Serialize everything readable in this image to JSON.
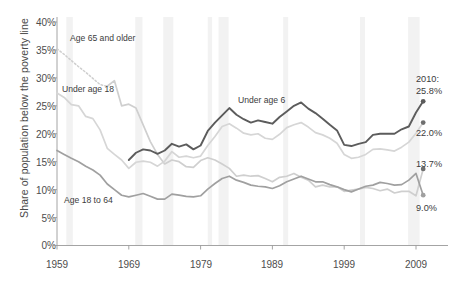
{
  "chart_data": {
    "type": "line",
    "title": "",
    "subtitle": "",
    "xlabel": "",
    "ylabel": "Share of population below the poverty line",
    "xlim": [
      1959,
      2011
    ],
    "ylim": [
      0,
      40
    ],
    "ytick_labels": [
      "0%",
      "5%",
      "10%",
      "15%",
      "20%",
      "25%",
      "30%",
      "35%",
      "40%"
    ],
    "ytick_values": [
      0,
      5,
      10,
      15,
      20,
      25,
      30,
      35,
      40
    ],
    "xtick_labels": [
      "1959",
      "1969",
      "1979",
      "1989",
      "1999",
      "2009"
    ],
    "xtick_values": [
      1959,
      1969,
      1979,
      1989,
      1999,
      2009
    ],
    "grid": false,
    "legend_position": "inline-annotations",
    "shaded_bands_note": "Vertical light-gray bands mark U.S. recessions",
    "recession_bands": [
      [
        1960.3,
        1961.2
      ],
      [
        1969.9,
        1970.9
      ],
      [
        1973.8,
        1975.2
      ],
      [
        1980.0,
        1980.6
      ],
      [
        1981.5,
        1982.9
      ],
      [
        1990.5,
        1991.2
      ],
      [
        2001.2,
        2001.9
      ],
      [
        2007.9,
        2009.5
      ]
    ],
    "series": [
      {
        "name": "Age 65 and older",
        "color": "#cfcfcf",
        "label_x": 70,
        "label_y": 38,
        "end_value": 13.7,
        "end_label": "13.7%",
        "dashed_segment": [
          1959,
          1966
        ],
        "x": [
          1959,
          1960,
          1961,
          1962,
          1963,
          1964,
          1965,
          1966,
          1967,
          1968,
          1969,
          1970,
          1971,
          1972,
          1973,
          1974,
          1975,
          1976,
          1977,
          1978,
          1979,
          1980,
          1981,
          1982,
          1983,
          1984,
          1985,
          1986,
          1987,
          1988,
          1989,
          1990,
          1991,
          1992,
          1993,
          1994,
          1995,
          1996,
          1997,
          1998,
          1999,
          2000,
          2001,
          2002,
          2003,
          2004,
          2005,
          2006,
          2007,
          2008,
          2009,
          2010
        ],
        "values": [
          35.2,
          34.2,
          33.1,
          32.0,
          31.0,
          29.9,
          28.8,
          28.5,
          29.5,
          25.0,
          25.3,
          24.6,
          21.6,
          18.6,
          16.3,
          14.6,
          15.3,
          15.0,
          14.1,
          14.0,
          15.2,
          15.7,
          15.3,
          14.6,
          13.8,
          12.4,
          12.6,
          12.4,
          12.5,
          12.0,
          11.4,
          12.2,
          12.4,
          12.9,
          12.2,
          11.7,
          10.5,
          10.8,
          10.5,
          10.5,
          9.7,
          9.9,
          10.1,
          10.4,
          10.2,
          9.8,
          10.1,
          9.4,
          9.7,
          9.7,
          8.9,
          13.7
        ]
      },
      {
        "name": "Under age 18",
        "color": "#d6d6d6",
        "label_x": 62,
        "label_y": 85,
        "end_value": 22.0,
        "end_label": "22.0%",
        "x": [
          1959,
          1960,
          1961,
          1962,
          1963,
          1964,
          1965,
          1966,
          1967,
          1968,
          1969,
          1970,
          1971,
          1972,
          1973,
          1974,
          1975,
          1976,
          1977,
          1978,
          1979,
          1980,
          1981,
          1982,
          1983,
          1984,
          1985,
          1986,
          1987,
          1988,
          1989,
          1990,
          1991,
          1992,
          1993,
          1994,
          1995,
          1996,
          1997,
          1998,
          1999,
          2000,
          2001,
          2002,
          2003,
          2004,
          2005,
          2006,
          2007,
          2008,
          2009,
          2010
        ],
        "values": [
          27.3,
          26.5,
          25.2,
          25.0,
          23.1,
          22.7,
          20.7,
          17.4,
          16.3,
          15.3,
          13.8,
          14.9,
          15.1,
          14.9,
          14.2,
          15.1,
          16.8,
          15.8,
          16.0,
          15.7,
          16.0,
          17.9,
          19.5,
          21.3,
          21.8,
          21.0,
          20.1,
          19.8,
          20.0,
          19.2,
          19.0,
          19.9,
          21.1,
          21.6,
          22.0,
          21.2,
          20.2,
          19.8,
          19.2,
          18.3,
          16.3,
          15.6,
          15.8,
          16.3,
          17.2,
          17.3,
          17.1,
          16.9,
          17.6,
          18.5,
          20.1,
          22.0
        ]
      },
      {
        "name": "Under age 6",
        "color": "#5c5c5c",
        "label_x": 238,
        "label_y": 93,
        "end_value": 25.8,
        "end_label": "25.8%",
        "x": [
          1969,
          1970,
          1971,
          1972,
          1973,
          1974,
          1975,
          1976,
          1977,
          1978,
          1979,
          1980,
          1981,
          1982,
          1983,
          1984,
          1985,
          1986,
          1987,
          1988,
          1989,
          1990,
          1991,
          1992,
          1993,
          1994,
          1995,
          1996,
          1997,
          1998,
          1999,
          2000,
          2001,
          2002,
          2003,
          2004,
          2005,
          2006,
          2007,
          2008,
          2009,
          2010
        ],
        "values": [
          15.3,
          16.6,
          17.2,
          17.0,
          16.4,
          17.0,
          18.2,
          17.7,
          18.1,
          17.2,
          17.9,
          20.5,
          22.0,
          23.3,
          24.6,
          23.4,
          22.6,
          22.0,
          22.4,
          22.1,
          21.8,
          23.0,
          24.0,
          25.0,
          25.6,
          24.5,
          23.7,
          22.7,
          21.6,
          20.6,
          18.0,
          17.8,
          18.2,
          18.5,
          19.8,
          20.0,
          20.0,
          20.0,
          20.8,
          21.3,
          23.8,
          25.8
        ]
      },
      {
        "name": "Age 18 to 64",
        "color": "#a0a0a0",
        "label_x": 64,
        "label_y": 195,
        "end_value": 9.0,
        "end_label": "9.0%",
        "x": [
          1959,
          1960,
          1961,
          1962,
          1963,
          1964,
          1965,
          1966,
          1967,
          1968,
          1969,
          1970,
          1971,
          1972,
          1973,
          1974,
          1975,
          1976,
          1977,
          1978,
          1979,
          1980,
          1981,
          1982,
          1983,
          1984,
          1985,
          1986,
          1987,
          1988,
          1989,
          1990,
          1991,
          1992,
          1993,
          1994,
          1995,
          1996,
          1997,
          1998,
          1999,
          2000,
          2001,
          2002,
          2003,
          2004,
          2005,
          2006,
          2007,
          2008,
          2009,
          2010
        ],
        "values": [
          17.0,
          16.3,
          15.6,
          15.0,
          14.2,
          13.5,
          12.6,
          11.0,
          10.0,
          9.0,
          8.7,
          9.0,
          9.3,
          8.8,
          8.3,
          8.3,
          9.2,
          9.0,
          8.8,
          8.7,
          8.9,
          10.1,
          11.1,
          12.0,
          12.4,
          11.7,
          11.3,
          10.8,
          10.6,
          10.5,
          10.2,
          10.7,
          11.4,
          11.9,
          12.4,
          11.9,
          11.4,
          11.4,
          10.9,
          10.5,
          10.0,
          9.6,
          10.1,
          10.6,
          10.8,
          11.3,
          11.1,
          10.8,
          10.9,
          11.7,
          12.9,
          9.0
        ]
      }
    ],
    "annotations": [
      {
        "name": "end-callout-under6",
        "text_line1": "2010:",
        "text_line2": "25.8%"
      },
      {
        "name": "end-callout-under18",
        "text": "22.0%"
      },
      {
        "name": "end-callout-65plus",
        "text": "13.7%"
      },
      {
        "name": "end-callout-18to64",
        "text": "9.0%"
      }
    ]
  },
  "labels": {
    "y_axis_title": "Share of population below the poverty line",
    "series_65plus": "Age 65 and older",
    "series_under18": "Under age 18",
    "series_under6": "Under age 6",
    "series_18to64": "Age 18 to 64",
    "callout_year": "2010:",
    "callout_under6": "25.8%",
    "callout_under18": "22.0%",
    "callout_65plus": "13.7%",
    "callout_18to64": "9.0%",
    "y0": "0%",
    "y5": "5%",
    "y10": "10%",
    "y15": "15%",
    "y20": "20%",
    "y25": "25%",
    "y30": "30%",
    "y35": "35%",
    "y40": "40%",
    "x1959": "1959",
    "x1969": "1969",
    "x1979": "1979",
    "x1989": "1989",
    "x1999": "1999",
    "x2009": "2009"
  }
}
